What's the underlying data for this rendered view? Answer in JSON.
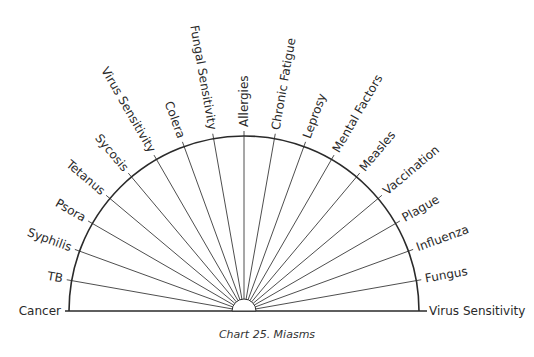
{
  "chart": {
    "title": "Chart 25. Miasms",
    "type": "semicircle-pendulum-chart",
    "center": [
      244,
      311
    ],
    "radius": 175,
    "inner_radius": 12,
    "line_color": "#2a2a2a",
    "labels": [
      "Cancer",
      "TB",
      "Syphilis",
      "Psora",
      "Tetanus",
      "Sycosis",
      "Virus Sensitivity",
      "Colera",
      "Fungal Sensitivity",
      "Allergies",
      "Chronic Fatigue",
      "Leprosy",
      "Mental Factors",
      "Measles",
      "Vaccination",
      "Plague",
      "Influenza",
      "Fungus",
      "Virus Sensitivity"
    ]
  }
}
